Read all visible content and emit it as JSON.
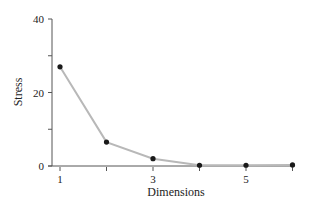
{
  "chart_data": {
    "type": "line",
    "title": "",
    "xlabel": "Dimensions",
    "ylabel": "Stress",
    "x": [
      1,
      2,
      3,
      4,
      5,
      6
    ],
    "series": [
      {
        "name": "Stress",
        "values": [
          27,
          6.5,
          2,
          0.2,
          0.2,
          0.3
        ],
        "color": "#b8b8b8",
        "marker_color": "#1a1a1a"
      }
    ],
    "xlim": [
      1,
      6
    ],
    "ylim": [
      0,
      40
    ],
    "x_ticks": [
      1,
      2,
      3,
      4,
      5,
      6
    ],
    "x_tick_labels": [
      "1",
      "",
      "3",
      "",
      "5",
      ""
    ],
    "y_ticks": [
      0,
      10,
      20,
      30,
      40
    ],
    "y_tick_labels": [
      "0",
      "",
      "20",
      "",
      "40"
    ],
    "grid": false,
    "legend": null
  }
}
